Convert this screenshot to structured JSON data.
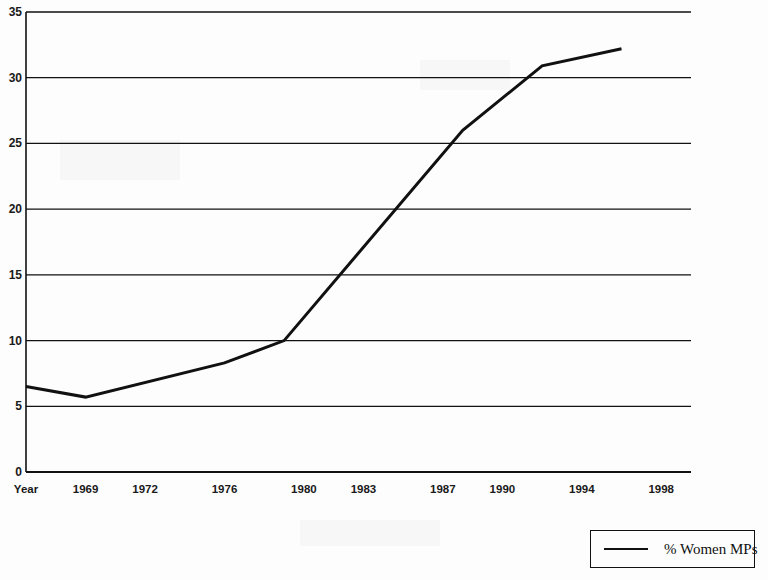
{
  "chart_data": {
    "type": "line",
    "title": "",
    "xlabel": "Year",
    "ylabel": "",
    "ylim": [
      0,
      35
    ],
    "xlim": [
      1966,
      1999.5
    ],
    "grid": true,
    "legend_position": "bottom-right",
    "y_ticks": [
      "0",
      "5",
      "10",
      "15",
      "20",
      "25",
      "30",
      "35"
    ],
    "y_tick_values": [
      0,
      5,
      10,
      15,
      20,
      25,
      30,
      35
    ],
    "x_tick_labels": [
      "Year",
      "1969",
      "1972",
      "1976",
      "1980",
      "1983",
      "1987",
      "1990",
      "1994",
      "1998"
    ],
    "x_tick_values": [
      1966,
      1969,
      1972,
      1976,
      1980,
      1983,
      1987,
      1990,
      1994,
      1998
    ],
    "series": [
      {
        "name": "% Women MPs",
        "color": "#111111",
        "x": [
          1966,
          1969,
          1976,
          1979,
          1988,
          1992,
          1996
        ],
        "values": [
          6.5,
          5.7,
          8.3,
          10.0,
          26.0,
          30.9,
          32.2
        ]
      }
    ],
    "legend_entries": [
      "% Women MPs"
    ]
  },
  "legend": {
    "label": "% Women MPs"
  },
  "axis": {
    "x_label": "Year"
  }
}
